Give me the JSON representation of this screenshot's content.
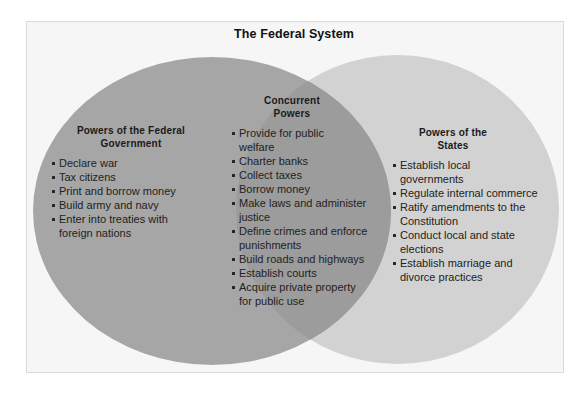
{
  "title": "The Federal System",
  "colors": {
    "frame_bg": "#f6f6f6",
    "frame_border": "#dadada",
    "federal_circle": "#a6a6a6",
    "states_circle": "#d2d2d2",
    "overlap": "#9c9c9c",
    "text": "#1e1e1e"
  },
  "federal": {
    "heading_line1": "Powers of the Federal",
    "heading_line2": "Government",
    "items": [
      "Declare war",
      "Tax citizens",
      "Print and borrow money",
      "Build army and navy",
      "Enter into treaties with foreign nations"
    ]
  },
  "concurrent": {
    "heading_line1": "Concurrent",
    "heading_line2": "Powers",
    "items": [
      "Provide for public welfare",
      "Charter banks",
      "Collect taxes",
      "Borrow money",
      "Make laws and administer justice",
      "Define crimes and enforce punishments",
      "Build roads and highways",
      "Establish courts",
      "Acquire private property for public use"
    ]
  },
  "states": {
    "heading_line1": "Powers of the",
    "heading_line2": "States",
    "items": [
      "Establish local governments",
      "Regulate internal commerce",
      "Ratify amendments to the Constitution",
      "Conduct local and state elections",
      "Establish marriage and divorce practices"
    ]
  }
}
